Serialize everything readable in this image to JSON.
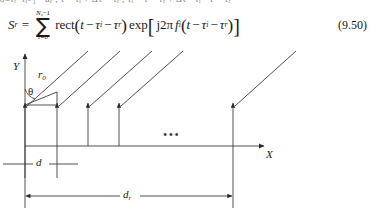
{
  "page": {
    "cut_top_line": "δ≡τᵢ−τᵢ₋₁ · αᵣ ,  τ = τᵢ + Δτ − τᵣ , τᵢ = τ − τᵣ + Δτ · τᵢ · τ − τᵣ"
  },
  "equation": {
    "lhs": "S",
    "lhs_sub": "r",
    "equals": "=",
    "sum_upper_var": "N",
    "sum_upper_var_sub": "s",
    "sum_upper_rest": "−1",
    "sum_symbol": "∑",
    "sum_lower": "i=0",
    "rect_fn": "rect",
    "rect_open": "(",
    "rect_arg_t": "t",
    "rect_minus1": "−",
    "rect_tau_i": "τ",
    "rect_tau_i_sub": "i",
    "rect_minus2": "−",
    "rect_tau_r": "τ",
    "rect_tau_r_sub": "r",
    "rect_close": ")",
    "exp_fn": "exp",
    "brk_open": "[",
    "j_term": "j2π",
    "f_i": "f",
    "f_i_sub": "i",
    "inner_open": "(",
    "inner_t": "t",
    "inner_minus1": "−",
    "inner_tau_i": "τ",
    "inner_tau_i_sub": "i",
    "inner_minus2": "−",
    "inner_tau_r": "τ",
    "inner_tau_r_sub": "r",
    "inner_close": ")",
    "brk_close": "]",
    "number": "(9.50)"
  },
  "figure": {
    "name": "uniform-linear-antenna-array-geometry",
    "axis_y_label": "Y",
    "axis_x_label": "X",
    "range_label": "r",
    "range_label_sub": "0",
    "angle_label": "θ",
    "spacing_label": "d",
    "aperture_label": "d",
    "aperture_label_sub": "r",
    "ellipsis": "•••",
    "element_count_shown": 5,
    "element_x_positions": [
      25,
      57,
      88,
      119,
      233
    ],
    "baseline_y": 98,
    "colors": {
      "ink": "#1a1a1a",
      "line": "#3d3d3d",
      "paper": "#ffffff"
    }
  }
}
